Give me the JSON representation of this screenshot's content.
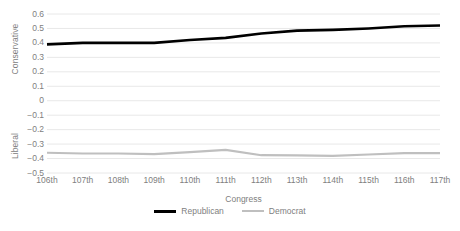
{
  "chart_data": {
    "type": "line",
    "title": "",
    "subtitle": "",
    "xlabel": "Congress",
    "ylabel": "",
    "ylabel_positive": "Conservative",
    "ylabel_negative": "Liberal",
    "categories": [
      "106th",
      "107th",
      "108th",
      "109th",
      "110th",
      "111th",
      "112th",
      "113th",
      "114th",
      "115th",
      "116th",
      "117th"
    ],
    "series": [
      {
        "name": "Republican",
        "color": "#000000",
        "values": [
          0.39,
          0.4,
          0.4,
          0.4,
          0.42,
          0.435,
          0.465,
          0.485,
          0.49,
          0.5,
          0.515,
          0.52
        ]
      },
      {
        "name": "Democrat",
        "color": "#bfbfbf",
        "values": [
          -0.36,
          -0.365,
          -0.365,
          -0.37,
          -0.355,
          -0.34,
          -0.377,
          -0.378,
          -0.382,
          -0.372,
          -0.363,
          -0.363
        ]
      }
    ],
    "ylim": [
      -0.5,
      0.6
    ],
    "yticks": [
      0.6,
      0.5,
      0.4,
      0.3,
      0.2,
      0.1,
      0,
      -0.1,
      -0.2,
      -0.3,
      -0.4,
      -0.5
    ],
    "ytick_labels": [
      "0.6",
      "0.5",
      "0.4",
      "0.3",
      "0.2",
      "0.1",
      "0",
      "−0.1",
      "−0.2",
      "−0.3",
      "−0.4",
      "−0.5"
    ],
    "grid": true,
    "grid_color": "#e8e8e8",
    "legend_position": "bottom",
    "legend": [
      {
        "label": "Republican",
        "color": "#000000"
      },
      {
        "label": "Democrat",
        "color": "#bfbfbf"
      }
    ],
    "axis_text_color": "#808080",
    "background": "#ffffff"
  }
}
